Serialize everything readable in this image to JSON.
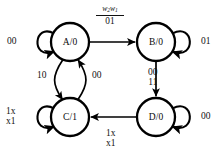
{
  "diagram": {
    "type": "moore-fsm-state-diagram",
    "stroke_color": "#000000",
    "text_color": "#111111",
    "background": "#ffffff"
  },
  "states": [
    {
      "id": "A",
      "label": "A/0",
      "name": "A",
      "output": "0",
      "cx": 70,
      "cy": 42,
      "r": 19
    },
    {
      "id": "B",
      "label": "B/0",
      "name": "B",
      "output": "0",
      "cx": 156,
      "cy": 42,
      "r": 19
    },
    {
      "id": "C",
      "label": "C/1",
      "name": "C",
      "output": "1",
      "cx": 70,
      "cy": 117,
      "r": 19
    },
    {
      "id": "D",
      "label": "D/0",
      "name": "D",
      "output": "0",
      "cx": 156,
      "cy": 117,
      "r": 19
    }
  ],
  "input_legend": {
    "numerator_text": "w2w1",
    "numerator_var1": "w",
    "numerator_sub1": "2",
    "numerator_var2": "w",
    "numerator_sub2": "1",
    "denominator": "01"
  },
  "transitions": [
    {
      "id": "a-self",
      "from": "A",
      "to": "A",
      "label": "00",
      "kind": "self-loop"
    },
    {
      "id": "a-to-b",
      "from": "A",
      "to": "B",
      "label": "01",
      "kind": "straight",
      "label_note": "shown as fraction w2w1 over 01"
    },
    {
      "id": "b-self",
      "from": "B",
      "to": "B",
      "label": "01",
      "kind": "self-loop"
    },
    {
      "id": "b-to-d",
      "from": "B",
      "to": "D",
      "label_line1": "00",
      "label_line2": "11",
      "kind": "straight"
    },
    {
      "id": "a-to-c",
      "from": "A",
      "to": "C",
      "label": "10",
      "kind": "curve"
    },
    {
      "id": "c-to-a",
      "from": "C",
      "to": "A",
      "label": "00",
      "kind": "curve"
    },
    {
      "id": "c-self",
      "from": "C",
      "to": "C",
      "label_line1": "1x",
      "label_line2": "x1",
      "kind": "self-loop"
    },
    {
      "id": "d-self",
      "from": "D",
      "to": "D",
      "label": "00",
      "kind": "self-loop"
    },
    {
      "id": "d-to-c",
      "from": "D",
      "to": "C",
      "label_line1": "1x",
      "label_line2": "x1",
      "kind": "straight"
    }
  ],
  "labels": {
    "a_self": "00",
    "b_self": "01",
    "d_self": "00",
    "c_self_line1": "1x",
    "c_self_line2": "x1",
    "bd_line1": "00",
    "bd_line2": "11",
    "dc_line1": "1x",
    "dc_line2": "x1",
    "ac_curve": "10",
    "ca_curve": "00",
    "ab_denominator": "01"
  }
}
